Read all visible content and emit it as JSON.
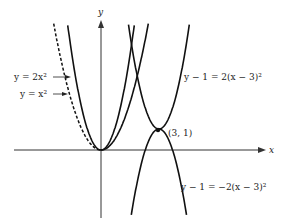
{
  "figure": {
    "axes": {
      "x_label": "x",
      "y_label": "y"
    },
    "labels": {
      "eq_2x2": "y = 2x²",
      "eq_x2": "y = x²",
      "eq_up": "y − 1 = 2(x − 3)²",
      "eq_down": "y − 1 = −2(x − 3)²",
      "point": "(3, 1)"
    },
    "colors": {
      "ink": "#111111",
      "background": "#ffffff"
    }
  },
  "chart_data": {
    "type": "line",
    "title": "",
    "xlabel": "x",
    "ylabel": "y",
    "grid": false,
    "series": [
      {
        "name": "y = x²",
        "equation": "y = x^2",
        "style": "dashed-left",
        "vertex": [
          0,
          0
        ],
        "a": 1
      },
      {
        "name": "y = 2x²",
        "equation": "y = 2x^2",
        "style": "solid",
        "vertex": [
          0,
          0
        ],
        "a": 2
      },
      {
        "name": "y − 1 = 2(x − 3)²",
        "equation": "y = 1 + 2(x-3)^2",
        "style": "solid",
        "vertex": [
          3,
          1
        ],
        "a": 2
      },
      {
        "name": "y − 1 = −2(x − 3)²",
        "equation": "y = 1 - 2(x-3)^2",
        "style": "solid",
        "vertex": [
          3,
          1
        ],
        "a": -2
      }
    ],
    "annotations": [
      {
        "text": "(3, 1)",
        "x": 3,
        "y": 1
      }
    ],
    "xlim": [
      -4.5,
      8.5
    ],
    "ylim": [
      -3.5,
      6.5
    ]
  }
}
